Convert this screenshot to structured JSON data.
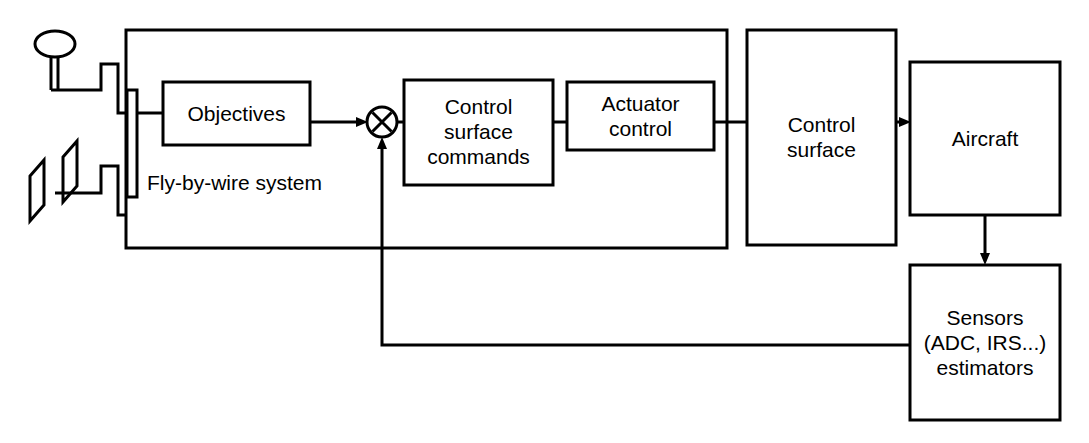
{
  "diagram": {
    "stroke_color": "#000000",
    "background_color": "#ffffff",
    "enclosure": {
      "label": "Fly-by-wire system",
      "name": "fly-by-wire-system-enclosure"
    },
    "inputs": [
      {
        "name": "control-stick",
        "label": ""
      },
      {
        "name": "rudder-pedals",
        "label": ""
      }
    ],
    "blocks": [
      {
        "name": "objectives-block",
        "label": "Objectives"
      },
      {
        "name": "summing-junction",
        "label": ""
      },
      {
        "name": "control-surface-commands-block",
        "label": "Control\nsurface\ncommands"
      },
      {
        "name": "actuator-control-block",
        "label": "Actuator\ncontrol"
      },
      {
        "name": "control-surface-block",
        "label": "Control\nsurface"
      },
      {
        "name": "aircraft-block",
        "label": "Aircraft"
      },
      {
        "name": "sensors-block",
        "label": "Sensors\n(ADC, IRS...)\nestimators"
      }
    ],
    "connections": [
      {
        "name": "stick-to-bus",
        "from": "control-stick",
        "to": "input-bus"
      },
      {
        "name": "pedals-to-bus",
        "from": "rudder-pedals",
        "to": "input-bus"
      },
      {
        "name": "bus-to-objectives",
        "from": "input-bus",
        "to": "objectives-block"
      },
      {
        "name": "objectives-to-sum",
        "from": "objectives-block",
        "to": "summing-junction",
        "arrow": true
      },
      {
        "name": "sum-to-commands",
        "from": "summing-junction",
        "to": "control-surface-commands-block"
      },
      {
        "name": "commands-to-actuator",
        "from": "control-surface-commands-block",
        "to": "actuator-control-block"
      },
      {
        "name": "actuator-to-control-surface",
        "from": "actuator-control-block",
        "to": "control-surface-block"
      },
      {
        "name": "control-surface-to-aircraft",
        "from": "control-surface-block",
        "to": "aircraft-block",
        "arrow": true
      },
      {
        "name": "aircraft-to-sensors",
        "from": "aircraft-block",
        "to": "sensors-block",
        "arrow": true
      },
      {
        "name": "sensors-feedback-to-sum",
        "from": "sensors-block",
        "to": "summing-junction",
        "arrow": true
      }
    ]
  }
}
